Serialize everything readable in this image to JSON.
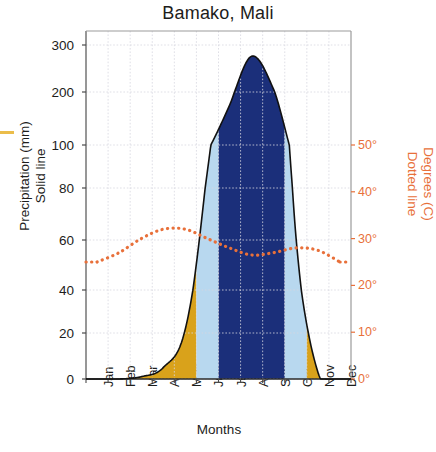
{
  "chart_data": {
    "type": "area",
    "title": "Bamako, Mali",
    "xlabel": "Months",
    "ylabel_left": "Precipitation (mm)\nSolid line",
    "ylabel_right": "Degrees (C)\nDotted line",
    "categories": [
      "Jan",
      "Feb",
      "Mar",
      "Apr",
      "May",
      "Jun",
      "Jul",
      "Aug",
      "Sep",
      "Oct",
      "Nov",
      "Dec"
    ],
    "left_axis": {
      "ticks": [
        0,
        20,
        40,
        60,
        80,
        100,
        200,
        300
      ],
      "tick_labels": [
        "0",
        "20",
        "40",
        "60",
        "80",
        "100",
        "200",
        "300"
      ],
      "scale": "broken-linear-above-100",
      "unit": "mm"
    },
    "right_axis": {
      "ticks": [
        0,
        10,
        20,
        30,
        40,
        50
      ],
      "tick_labels": [
        "0°",
        "10°",
        "20°",
        "30°",
        "40°",
        "50°"
      ],
      "unit": "C",
      "color": "#e8703a"
    },
    "series": [
      {
        "name": "Precipitation (mm)",
        "style": "solid-line-filled",
        "values": [
          0,
          0,
          1,
          5,
          22,
          88,
          175,
          276,
          205,
          62,
          3,
          0
        ]
      },
      {
        "name": "Degrees (C)",
        "style": "dotted-line",
        "color": "#e8703a",
        "values": [
          25,
          27,
          30,
          32,
          32,
          30,
          28,
          26.5,
          27,
          28,
          27.5,
          25
        ]
      }
    ],
    "season_bands": [
      {
        "name": "dry-season-band",
        "from": "Jan",
        "to": "May",
        "color": "#d9a21b"
      },
      {
        "name": "transition-band-early",
        "from": "Jun",
        "to": "Jun",
        "color": "#b8d8ef"
      },
      {
        "name": "wet-season-band",
        "from": "Jul",
        "to": "Sep",
        "color": "#1b2f7a"
      },
      {
        "name": "transition-band-late",
        "from": "Oct",
        "to": "Oct",
        "color": "#b8d8ef"
      },
      {
        "name": "dry-season-band-late",
        "from": "Nov",
        "to": "Dec",
        "color": "#d9a21b"
      }
    ],
    "grid": true,
    "legend_position": "none"
  },
  "colors": {
    "gold": "#d9a21b",
    "light_blue": "#b8d8ef",
    "navy": "#1b2f7a",
    "temp_orange": "#e8703a",
    "axis": "#5a5a5a",
    "grid": "#d7d7e0"
  }
}
